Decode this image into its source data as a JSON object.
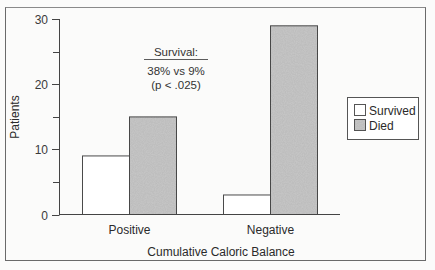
{
  "chart_data": {
    "type": "bar",
    "title": "",
    "xlabel": "Cumulative Caloric Balance",
    "ylabel": "Patients",
    "ylim": [
      0,
      30
    ],
    "yticks": [
      0,
      10,
      20,
      30
    ],
    "yminor_ticks": [
      5,
      15,
      25
    ],
    "grid": false,
    "categories": [
      "Positive",
      "Negative"
    ],
    "series": [
      {
        "name": "Survived",
        "values": [
          9,
          3
        ],
        "color": "#ffffff"
      },
      {
        "name": "Died",
        "values": [
          15,
          29
        ],
        "color": "#c8c8c8"
      }
    ],
    "legend_position": "right",
    "annotation": {
      "heading": "Survival:",
      "line1": "38% vs 9%",
      "line2": "(p < .025)"
    }
  }
}
